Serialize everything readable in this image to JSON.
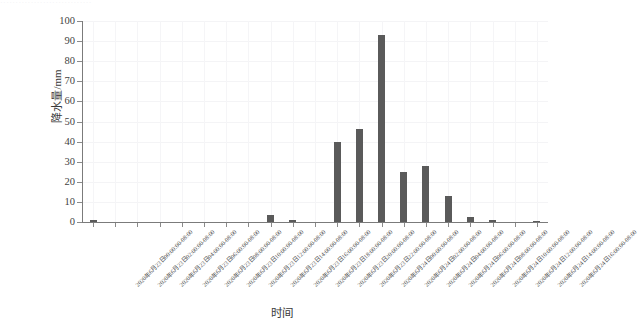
{
  "top_sliver": {
    "text": "······························"
  },
  "chart_data": {
    "type": "bar",
    "title": "",
    "xlabel": "时间",
    "ylabel": "降水量/mm",
    "ylim": [
      0,
      100
    ],
    "ytick_values": [
      0,
      10,
      20,
      30,
      40,
      50,
      60,
      70,
      80,
      90,
      100
    ],
    "ytick_labels": [
      "0",
      "10",
      "20",
      "30",
      "40",
      "50",
      "60",
      "70",
      "80",
      "90",
      "100"
    ],
    "grid": true,
    "legend": "none",
    "bar_color": "#5a5a5a",
    "categories": [
      "2020年6月23日00:00:00-08:00",
      "2020年6月23日02:00:00-08:00",
      "2020年6月23日04:00:00-08:00",
      "2020年6月23日06:00:00-08:00",
      "2020年6月23日08:00:00-08:00",
      "2020年6月23日10:00:00-08:00",
      "2020年6月23日12:00:00-08:00",
      "2020年6月23日14:00:00-08:00",
      "2020年6月23日16:00:00-08:00",
      "2020年6月23日18:00:00-08:00",
      "2020年6月23日20:00:00-08:00",
      "2020年6月23日22:00:00-08:00",
      "2020年6月24日00:00:00-08:00",
      "2020年6月24日02:00:00-08:00",
      "2020年6月24日04:00:00-08:00",
      "2020年6月24日06:00:00-08:00",
      "2020年6月24日08:00:00-08:00",
      "2020年6月24日10:00:00-08:00",
      "2020年6月24日12:00:00-08:00",
      "2020年6月24日14:00:00-08:00",
      "2020年6月24日16:00:00-08:00"
    ],
    "values": [
      1.2,
      0,
      0,
      0,
      0,
      0,
      0,
      0,
      3.5,
      1.0,
      0,
      40,
      46.5,
      93,
      25,
      28,
      13,
      2.5,
      1.0,
      0,
      0.5
    ]
  }
}
